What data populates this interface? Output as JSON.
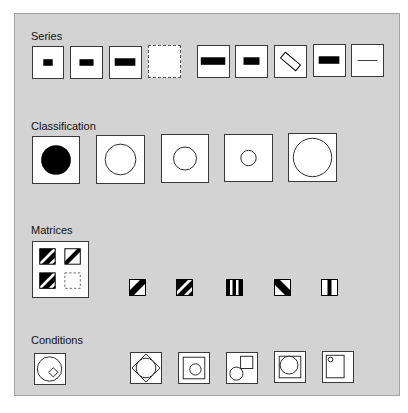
{
  "sections": {
    "series": {
      "title": "Series",
      "items": [
        {
          "name": "series-small-bar",
          "glyph": "bar-small"
        },
        {
          "name": "series-medium-bar",
          "glyph": "bar-medium"
        },
        {
          "name": "series-large-bar",
          "glyph": "bar-large"
        },
        {
          "name": "series-empty-dashed",
          "glyph": "empty-dashed"
        },
        {
          "name": "series-wide-bar",
          "glyph": "bar-wide"
        },
        {
          "name": "series-medium-bar-2",
          "glyph": "bar-medium"
        },
        {
          "name": "series-rotated-outline-bar",
          "glyph": "bar-rotated-outline"
        },
        {
          "name": "series-large-bar-2",
          "glyph": "bar-large"
        },
        {
          "name": "series-thin-line",
          "glyph": "line-thin"
        }
      ]
    },
    "classification": {
      "title": "Classification",
      "items": [
        {
          "name": "class-filled-circle",
          "glyph": "circle-filled-large"
        },
        {
          "name": "class-outline-circle-large",
          "glyph": "circle-outline-large"
        },
        {
          "name": "class-outline-circle-medium",
          "glyph": "circle-outline-medium"
        },
        {
          "name": "class-outline-circle-small",
          "glyph": "circle-outline-small"
        },
        {
          "name": "class-outline-circle-xlarge",
          "glyph": "circle-outline-xlarge"
        }
      ]
    },
    "matrices": {
      "title": "Matrices",
      "grid": [
        {
          "name": "matrix-double-stripe",
          "glyph": "stripe-diagonal-double"
        },
        {
          "name": "matrix-single-stripe",
          "glyph": "stripe-diagonal-single"
        },
        {
          "name": "matrix-double-stripe-2",
          "glyph": "stripe-diagonal-double"
        },
        {
          "name": "matrix-empty-dashed",
          "glyph": "empty-dashed"
        }
      ],
      "items": [
        {
          "name": "matrix-single-stripe-option",
          "glyph": "stripe-diagonal-single"
        },
        {
          "name": "matrix-double-stripe-option",
          "glyph": "stripe-diagonal-double"
        },
        {
          "name": "matrix-vertical-bars-option",
          "glyph": "stripe-vertical-double"
        },
        {
          "name": "matrix-back-diagonal-option",
          "glyph": "stripe-back-diagonal"
        },
        {
          "name": "matrix-vertical-single-option",
          "glyph": "stripe-vertical-single"
        }
      ]
    },
    "conditions": {
      "title": "Conditions",
      "items": [
        {
          "name": "cond-circle-with-diamond",
          "glyph": "circle-diamond"
        },
        {
          "name": "cond-diamond-with-circle",
          "glyph": "diamond-circle"
        },
        {
          "name": "cond-square-with-small-circle",
          "glyph": "square-small-circle"
        },
        {
          "name": "cond-overlapping-circle-square",
          "glyph": "circle-square-overlap"
        },
        {
          "name": "cond-square-with-large-circle",
          "glyph": "square-large-circle"
        },
        {
          "name": "cond-rect-with-dot",
          "glyph": "rect-dot"
        }
      ]
    }
  },
  "colors": {
    "panel_bg": "#d3d3d3",
    "panel_border": "#a3a3a3",
    "box_bg": "#ffffff",
    "ink": "#000000"
  }
}
